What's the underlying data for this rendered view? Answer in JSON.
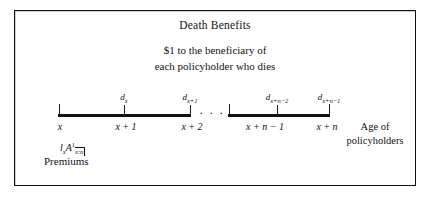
{
  "figure": {
    "title": "Death Benefits",
    "subtitle_line1": "$1 to the beneficiary of",
    "subtitle_line2": "each policyholder who dies",
    "ellipsis": "· · ·",
    "axis_caption_line1": "Age of",
    "axis_caption_line2": "policyholders",
    "premium_label": "Premiums",
    "premium_symbol_l": "l",
    "premium_symbol_l_sub": "x",
    "premium_symbol_a": "A",
    "premium_symbol_a_sup": "1",
    "premium_symbol_a_sub": "x:n",
    "colors": {
      "ink": "#111111",
      "background": "#ffffff",
      "frame": "#111111"
    }
  },
  "chart_data": {
    "type": "line",
    "title": "Death Benefits",
    "xlabel": "Age of policyholders",
    "ylabel": "",
    "tick_labels": [
      "x",
      "x + 1",
      "x + 2",
      "x + n − 1",
      "x + n"
    ],
    "death_labels": [
      {
        "base": "d",
        "sub": "x"
      },
      {
        "base": "d",
        "sub": "x+1"
      },
      {
        "base": "d",
        "sub": "x+n−2"
      },
      {
        "base": "d",
        "sub": "x+n−1"
      }
    ],
    "break_marker": "· · ·"
  }
}
